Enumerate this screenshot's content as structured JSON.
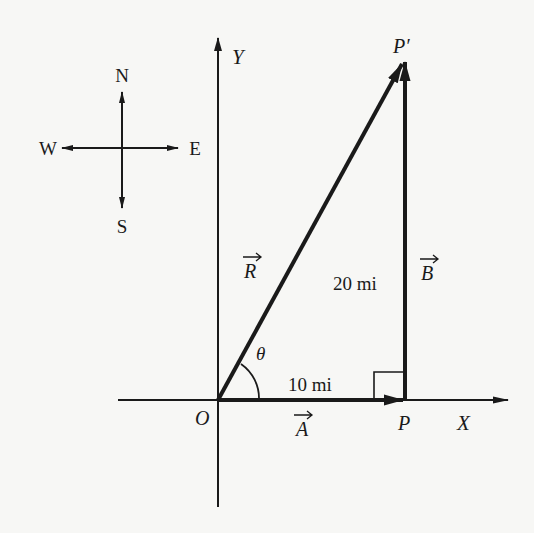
{
  "figure": {
    "type": "vector-addition-diagram",
    "compass": {
      "north": "N",
      "south": "S",
      "east": "E",
      "west": "W"
    },
    "axes": {
      "x_label": "X",
      "y_label": "Y",
      "origin_label": "O"
    },
    "points": {
      "p": "P",
      "p_prime": "P′"
    },
    "vectors": {
      "a": {
        "label": "A",
        "magnitude_label": "10 mi",
        "direction": "east"
      },
      "b": {
        "label": "B",
        "magnitude_label": "20 mi",
        "direction": "north"
      },
      "r": {
        "label": "R",
        "direction": "resultant"
      }
    },
    "angle_label": "θ",
    "colors": {
      "ink": "#1a1a1a",
      "paper": "#f7f7f5"
    }
  }
}
